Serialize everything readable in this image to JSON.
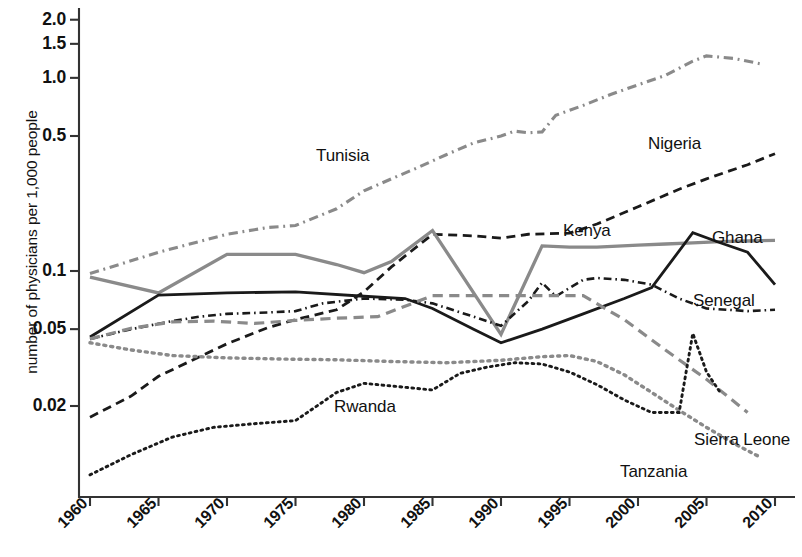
{
  "chart_data": {
    "type": "line",
    "title": "",
    "xlabel": "",
    "ylabel": "number of physicians per 1,000 people",
    "yscale": "log",
    "ylim": [
      0.008,
      2.2
    ],
    "xlim": [
      1960,
      2010
    ],
    "grid": false,
    "legend_position": "inline-labels",
    "y_ticks": [
      "2.0",
      "1.5",
      "1.0",
      "0.5",
      "0.1",
      "0.05",
      "0.02"
    ],
    "y_tick_values": [
      2.0,
      1.5,
      1.0,
      0.5,
      0.1,
      0.05,
      0.02
    ],
    "x_ticks": [
      "1960",
      "1965",
      "1970",
      "1975",
      "1980",
      "1985",
      "1990",
      "1995",
      "2000",
      "2005",
      "2010"
    ],
    "x_tick_values": [
      1960,
      1965,
      1970,
      1975,
      1980,
      1985,
      1990,
      1995,
      2000,
      2005,
      2010
    ],
    "series": [
      {
        "name": "Tunisia",
        "color": "#8a8a8a",
        "style": "dashdot",
        "width": 3.1,
        "label_x": 316,
        "label_y": 146,
        "x": [
          1960,
          1965,
          1970,
          1973,
          1975,
          1978,
          1980,
          1982,
          1984,
          1986,
          1988,
          1990,
          1991,
          1992,
          1993,
          1994,
          1996,
          1998,
          2000,
          2002,
          2004,
          2005,
          2007,
          2009
        ],
        "y": [
          0.097,
          0.125,
          0.155,
          0.168,
          0.172,
          0.21,
          0.26,
          0.3,
          0.345,
          0.4,
          0.46,
          0.5,
          0.53,
          0.52,
          0.525,
          0.64,
          0.72,
          0.82,
          0.92,
          1.03,
          1.22,
          1.3,
          1.26,
          1.18
        ]
      },
      {
        "name": "Nigeria",
        "color": "#1a1a1a",
        "style": "dashed",
        "width": 2.8,
        "label_x": 648,
        "label_y": 134,
        "x": [
          1960,
          1963,
          1965,
          1968,
          1970,
          1973,
          1975,
          1978,
          1980,
          1982,
          1985,
          1988,
          1990,
          1992,
          1995,
          1997,
          2000,
          2003,
          2005,
          2008,
          2010
        ],
        "y": [
          0.0175,
          0.0225,
          0.0285,
          0.036,
          0.042,
          0.051,
          0.056,
          0.063,
          0.078,
          0.105,
          0.155,
          0.152,
          0.148,
          0.155,
          0.157,
          0.175,
          0.215,
          0.265,
          0.3,
          0.355,
          0.405
        ]
      },
      {
        "name": "Kenya",
        "color": "#8a8a8a",
        "style": "solid",
        "width": 3.3,
        "label_x": 563,
        "label_y": 221,
        "x": [
          1960,
          1965,
          1970,
          1975,
          1978,
          1980,
          1982,
          1985,
          1990,
          1993,
          1995,
          1997,
          2000,
          2002,
          2004,
          2006,
          2008,
          2010
        ],
        "y": [
          0.093,
          0.077,
          0.122,
          0.122,
          0.108,
          0.098,
          0.112,
          0.162,
          0.047,
          0.135,
          0.133,
          0.133,
          0.136,
          0.138,
          0.14,
          0.142,
          0.143,
          0.144
        ]
      },
      {
        "name": "Ghana",
        "color": "#1a1a1a",
        "style": "solid",
        "width": 2.8,
        "label_x": 712,
        "label_y": 228,
        "x": [
          1960,
          1965,
          1970,
          1975,
          1980,
          1983,
          1985,
          1988,
          1990,
          1993,
          1996,
          1999,
          2001,
          2004,
          2006,
          2008,
          2010
        ],
        "y": [
          0.0455,
          0.075,
          0.077,
          0.078,
          0.074,
          0.072,
          0.064,
          0.05,
          0.0425,
          0.05,
          0.06,
          0.072,
          0.082,
          0.158,
          0.14,
          0.125,
          0.085
        ]
      },
      {
        "name": "Senegal",
        "color": "#1a1a1a",
        "style": "dashdot",
        "width": 2.6,
        "label_x": 693,
        "label_y": 291,
        "x": [
          1960,
          1963,
          1966,
          1968,
          1970,
          1973,
          1975,
          1977,
          1980,
          1983,
          1985,
          1988,
          1990,
          1992,
          1993,
          1994,
          1996,
          1997,
          1999,
          2001,
          2003,
          2005,
          2008,
          2010
        ],
        "y": [
          0.0445,
          0.05,
          0.055,
          0.058,
          0.06,
          0.061,
          0.062,
          0.068,
          0.072,
          0.071,
          0.068,
          0.058,
          0.052,
          0.07,
          0.087,
          0.074,
          0.09,
          0.092,
          0.09,
          0.085,
          0.072,
          0.064,
          0.062,
          0.063
        ]
      },
      {
        "name": "Sierra Leone",
        "color": "#8a8a8a",
        "style": "dashed",
        "width": 3.2,
        "label_x": 694,
        "label_y": 430,
        "x": [
          1960,
          1963,
          1966,
          1969,
          1972,
          1975,
          1978,
          1981,
          1985,
          1988,
          1990,
          1993,
          1996,
          1999,
          2002,
          2005,
          2008
        ],
        "y": [
          0.0445,
          0.0505,
          0.0545,
          0.055,
          0.0535,
          0.0555,
          0.057,
          0.058,
          0.0745,
          0.0745,
          0.0745,
          0.0745,
          0.0745,
          0.056,
          0.039,
          0.0275,
          0.0185
        ]
      },
      {
        "name": "Tanzania",
        "color": "#8a8a8a",
        "style": "dotted",
        "width": 3.4,
        "label_x": 620,
        "label_y": 462,
        "x": [
          1960,
          1963,
          1966,
          1970,
          1974,
          1978,
          1982,
          1986,
          1990,
          1993,
          1995,
          1997,
          1999,
          2001,
          2003,
          2005,
          2007,
          2009
        ],
        "y": [
          0.0425,
          0.039,
          0.0365,
          0.0355,
          0.035,
          0.0347,
          0.034,
          0.0335,
          0.0345,
          0.036,
          0.0365,
          0.034,
          0.029,
          0.0235,
          0.019,
          0.0155,
          0.0128,
          0.0108
        ]
      },
      {
        "name": "Rwanda",
        "color": "#1a1a1a",
        "style": "dotted",
        "width": 2.9,
        "label_x": 334,
        "label_y": 397,
        "x": [
          1960,
          1963,
          1966,
          1969,
          1972,
          1975,
          1978,
          1980,
          1983,
          1985,
          1987,
          1989,
          1991,
          1993,
          1995,
          1997,
          1999,
          2001,
          2003,
          2004,
          2005,
          2006
        ],
        "y": [
          0.0088,
          0.0112,
          0.0138,
          0.0155,
          0.0162,
          0.0168,
          0.0235,
          0.0262,
          0.025,
          0.0242,
          0.0295,
          0.0318,
          0.0335,
          0.033,
          0.03,
          0.0258,
          0.0215,
          0.0185,
          0.0185,
          0.0475,
          0.03,
          0.0235
        ]
      }
    ]
  }
}
